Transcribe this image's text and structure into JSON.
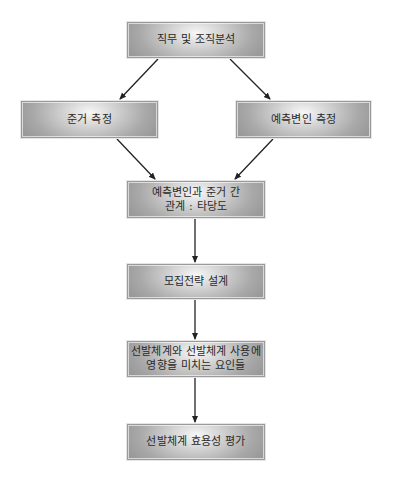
{
  "diagram": {
    "type": "flowchart",
    "nodes": {
      "job_org_analysis": {
        "label": "직무 및 조직분석"
      },
      "criterion_measure": {
        "label": "준거 측정"
      },
      "predictor_measure": {
        "label": "예측변인 측정"
      },
      "validity": {
        "line1": "예측변인과 준거 간",
        "line2": "관계 : 타당도"
      },
      "recruitment": {
        "label": "모집전략 설계"
      },
      "factors": {
        "line1": "선발체계와 선발체계 사용에",
        "line2": "영향을 미치는 요인들"
      },
      "utility": {
        "label": "선발체계 효용성 평가"
      }
    },
    "edges": [
      {
        "from": "job_org_analysis",
        "to": "criterion_measure"
      },
      {
        "from": "job_org_analysis",
        "to": "predictor_measure"
      },
      {
        "from": "criterion_measure",
        "to": "validity"
      },
      {
        "from": "predictor_measure",
        "to": "validity"
      },
      {
        "from": "validity",
        "to": "recruitment"
      },
      {
        "from": "recruitment",
        "to": "factors"
      },
      {
        "from": "factors",
        "to": "utility"
      }
    ],
    "colors": {
      "box_fill_light": "#f7f7f7",
      "box_fill_dark": "#999999",
      "box_border": "#9a9a9a",
      "arrow": "#222222",
      "text": "#2a2a2a"
    }
  }
}
